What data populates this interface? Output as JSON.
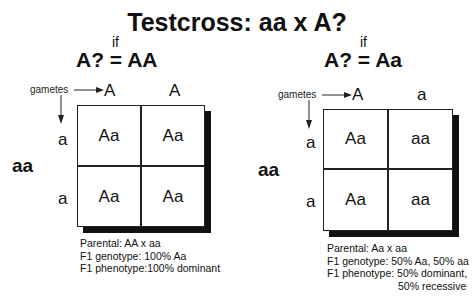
{
  "title": "Testcross: aa x A?",
  "panels": [
    {
      "condition_label": "if",
      "equation": "A? = AA",
      "gametes_label": "gametes",
      "top_gametes": [
        "A",
        "A"
      ],
      "side_gametes": [
        "a",
        "a"
      ],
      "parent_genotype": "aa",
      "cells": [
        [
          "Aa",
          "Aa"
        ],
        [
          "Aa",
          "Aa"
        ]
      ],
      "info": {
        "parental": "Parental: AA x aa",
        "f1_genotype": "F1 genotype: 100% Aa",
        "f1_phenotype": "F1 phenotype:100% dominant"
      }
    },
    {
      "condition_label": "if",
      "equation": "A? = Aa",
      "gametes_label": "gametes",
      "top_gametes": [
        "A",
        "a"
      ],
      "side_gametes": [
        "a",
        "a"
      ],
      "parent_genotype": "aa",
      "cells": [
        [
          "Aa",
          "aa"
        ],
        [
          "Aa",
          "aa"
        ]
      ],
      "info": {
        "parental": "Parental: Aa x aa",
        "f1_genotype": "F1 genotype: 50% Aa, 50% aa",
        "f1_phenotype": "F1 phenotype: 50% dominant,",
        "f1_phenotype_cont": "50% recessive"
      }
    }
  ]
}
